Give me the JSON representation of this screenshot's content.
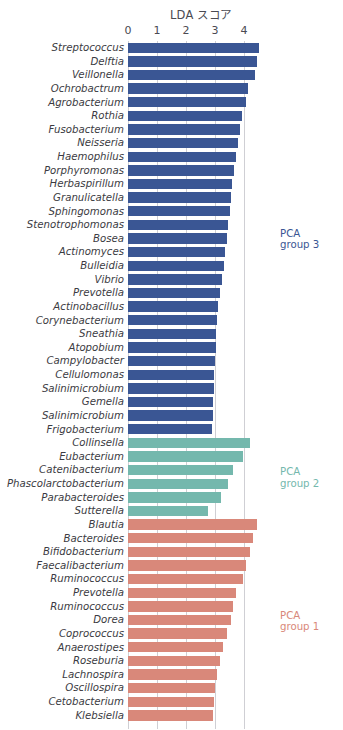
{
  "chart_data": {
    "type": "bar",
    "title": "LDA スコア",
    "xlabel": "",
    "ylabel": "",
    "orientation": "horizontal",
    "xlim": [
      0,
      5
    ],
    "xticks": [
      0,
      1,
      2,
      3,
      4
    ],
    "xtick_labels": [
      "0",
      "1",
      "2",
      "3",
      "4"
    ],
    "grid": true,
    "legend_position": "right",
    "categories": [
      "Streptococcus",
      "Delftia",
      "Veillonella",
      "Ochrobactrum",
      "Agrobacterium",
      "Rothia",
      "Fusobacterium",
      "Neisseria",
      "Haemophilus",
      "Porphyromonas",
      "Herbaspirillum",
      "Granulicatella",
      "Sphingomonas",
      "Stenotrophomonas",
      "Bosea",
      "Actinomyces",
      "Bulleidia",
      "Vibrio",
      "Prevotella",
      "Actinobacillus",
      "Corynebacterium",
      "Sneathia",
      "Atopobium",
      "Campylobacter",
      "Cellulomonas",
      "Salinimicrobium",
      "Gemella",
      "Salinimicrobium",
      "Frigobacterium",
      "Collinsella",
      "Eubacterium",
      "Catenibacterium",
      "Phascolarctobacterium",
      "Parabacteroides",
      "Sutterella",
      "Blautia",
      "Bacteroides",
      "Bifidobacterium",
      "Faecalibacterium",
      "Ruminococcus",
      "Prevotella",
      "Ruminococcus",
      "Dorea",
      "Coprococcus",
      "Anaerostipes",
      "Roseburia",
      "Lachnospira",
      "Oscillospira",
      "Cetobacterium",
      "Klebsiella"
    ],
    "values": [
      4.52,
      4.44,
      4.38,
      4.14,
      4.06,
      3.92,
      3.86,
      3.78,
      3.72,
      3.66,
      3.58,
      3.54,
      3.5,
      3.46,
      3.42,
      3.36,
      3.32,
      3.24,
      3.16,
      3.12,
      3.08,
      3.04,
      3.02,
      3.0,
      2.98,
      2.96,
      2.94,
      2.92,
      2.9,
      4.22,
      3.96,
      3.62,
      3.46,
      3.2,
      2.76,
      4.46,
      4.3,
      4.22,
      4.06,
      3.96,
      3.74,
      3.62,
      3.56,
      3.42,
      3.28,
      3.18,
      3.06,
      3.0,
      2.96,
      2.92
    ],
    "group_assignments": [
      "group3",
      "group3",
      "group3",
      "group3",
      "group3",
      "group3",
      "group3",
      "group3",
      "group3",
      "group3",
      "group3",
      "group3",
      "group3",
      "group3",
      "group3",
      "group3",
      "group3",
      "group3",
      "group3",
      "group3",
      "group3",
      "group3",
      "group3",
      "group3",
      "group3",
      "group3",
      "group3",
      "group3",
      "group3",
      "group2",
      "group2",
      "group2",
      "group2",
      "group2",
      "group2",
      "group1",
      "group1",
      "group1",
      "group1",
      "group1",
      "group1",
      "group1",
      "group1",
      "group1",
      "group1",
      "group1",
      "group1",
      "group1",
      "group1",
      "group1"
    ],
    "groups": [
      {
        "key": "group3",
        "label": "PCA\ngroup 3",
        "color": "#3a5694",
        "count": 29
      },
      {
        "key": "group2",
        "label": "PCA\ngroup 2",
        "color": "#74b8ad",
        "count": 6
      },
      {
        "key": "group1",
        "label": "PCA\ngroup 1",
        "color": "#d9887a",
        "count": 15
      }
    ]
  },
  "colors": {
    "group3": "#3a5694",
    "group2": "#74b8ad",
    "group1": "#d9887a",
    "gridline": "#cfcfd4",
    "text": "#3b3b42",
    "tick_text": "#4a4a52",
    "background": "#ffffff"
  }
}
